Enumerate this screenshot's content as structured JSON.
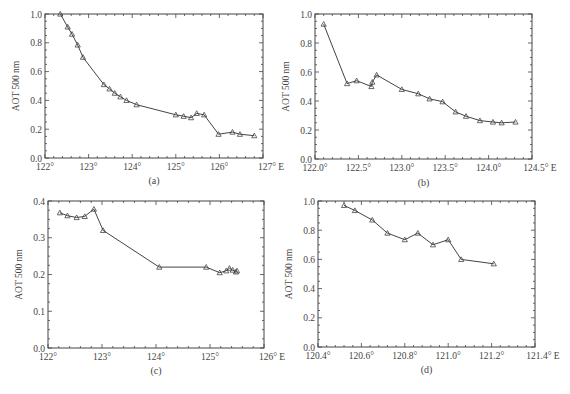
{
  "figure": {
    "ylabel": "AOT 500 nm",
    "marker": "triangle",
    "line_color": "#444444",
    "axis_color": "#444444",
    "background": "#ffffff"
  },
  "chart_data": [
    {
      "id": "a",
      "type": "line",
      "panel_label": "(a)",
      "title": "",
      "xlabel": "",
      "ylabel": "AOT 500 nm",
      "xlim": [
        122,
        127
      ],
      "ylim": [
        0.0,
        1.0
      ],
      "xticks": [
        122,
        123,
        124,
        125,
        126,
        127
      ],
      "xtick_labels": [
        "122°",
        "123°",
        "124°",
        "125°",
        "126°",
        "127° E"
      ],
      "yticks": [
        0.0,
        0.2,
        0.4,
        0.6,
        0.8,
        1.0
      ],
      "ytick_labels": [
        "0.0",
        "0.2",
        "0.4",
        "0.6",
        "0.8",
        "1.0"
      ],
      "grid": false,
      "legend": null,
      "series": [
        {
          "name": "AOT",
          "x": [
            122.35,
            122.52,
            122.62,
            122.75,
            122.87,
            123.35,
            123.48,
            123.6,
            123.73,
            123.87,
            124.1,
            125.0,
            125.18,
            125.35,
            125.48,
            125.65,
            125.98,
            126.3,
            126.47,
            126.8
          ],
          "y": [
            1.0,
            0.91,
            0.86,
            0.785,
            0.7,
            0.51,
            0.48,
            0.45,
            0.425,
            0.4,
            0.37,
            0.3,
            0.29,
            0.28,
            0.31,
            0.3,
            0.165,
            0.18,
            0.165,
            0.155
          ]
        }
      ]
    },
    {
      "id": "b",
      "type": "line",
      "panel_label": "(b)",
      "title": "",
      "xlabel": "",
      "ylabel": "AOT 500 nm",
      "xlim": [
        122.0,
        124.5
      ],
      "ylim": [
        0.0,
        1.0
      ],
      "xticks": [
        122.0,
        122.5,
        123.0,
        123.5,
        124.0,
        124.5
      ],
      "xtick_labels": [
        "122.0°",
        "122.5°",
        "123.0°",
        "123.5°",
        "124.0°",
        "124.5° E"
      ],
      "yticks": [
        0.0,
        0.2,
        0.4,
        0.6,
        0.8,
        1.0
      ],
      "ytick_labels": [
        "0.0",
        "0.2",
        "0.4",
        "0.6",
        "0.8",
        "1.0"
      ],
      "grid": false,
      "legend": null,
      "series": [
        {
          "name": "AOT",
          "x": [
            122.1,
            122.37,
            122.48,
            122.65,
            122.66,
            122.71,
            123.0,
            123.19,
            123.32,
            123.47,
            123.62,
            123.74,
            123.9,
            124.05,
            124.15,
            124.31
          ],
          "y": [
            0.93,
            0.52,
            0.54,
            0.5,
            0.53,
            0.58,
            0.48,
            0.45,
            0.415,
            0.395,
            0.325,
            0.295,
            0.265,
            0.255,
            0.25,
            0.255
          ]
        }
      ]
    },
    {
      "id": "c",
      "type": "line",
      "panel_label": "(c)",
      "title": "",
      "xlabel": "",
      "ylabel": "AOT 500 nm",
      "xlim": [
        122,
        126
      ],
      "ylim": [
        0.0,
        0.4
      ],
      "xticks": [
        122,
        123,
        124,
        125,
        126
      ],
      "xtick_labels": [
        "122°",
        "123°",
        "124°",
        "125°",
        "126° E"
      ],
      "yticks": [
        0.0,
        0.1,
        0.2,
        0.3,
        0.4
      ],
      "ytick_labels": [
        "0.0",
        "0.1",
        "0.2",
        "0.3",
        "0.4"
      ],
      "grid": false,
      "legend": null,
      "series": [
        {
          "name": "AOT",
          "x": [
            122.22,
            122.36,
            122.53,
            122.68,
            122.85,
            123.02,
            124.06,
            124.93,
            125.18,
            125.3,
            125.36,
            125.42,
            125.48,
            125.5
          ],
          "y": [
            0.368,
            0.36,
            0.355,
            0.358,
            0.378,
            0.32,
            0.22,
            0.22,
            0.205,
            0.21,
            0.217,
            0.212,
            0.207,
            0.21
          ]
        }
      ]
    },
    {
      "id": "d",
      "type": "line",
      "panel_label": "(d)",
      "title": "",
      "xlabel": "",
      "ylabel": "AOT 500 nm",
      "xlim": [
        120.4,
        121.4
      ],
      "ylim": [
        0.0,
        1.0
      ],
      "xticks": [
        120.4,
        120.6,
        120.8,
        121.0,
        121.2,
        121.4
      ],
      "xtick_labels": [
        "120.4°",
        "120.6°",
        "120.8°",
        "121.0°",
        "121.2°",
        "121.4° E"
      ],
      "yticks": [
        0.0,
        0.2,
        0.4,
        0.6,
        0.8,
        1.0
      ],
      "ytick_labels": [
        "0.0",
        "0.2",
        "0.4",
        "0.6",
        "0.8",
        "1.0"
      ],
      "grid": false,
      "legend": null,
      "series": [
        {
          "name": "AOT",
          "x": [
            120.52,
            120.57,
            120.65,
            120.72,
            120.8,
            120.86,
            120.93,
            121.0,
            121.06,
            121.21
          ],
          "y": [
            0.97,
            0.935,
            0.87,
            0.78,
            0.735,
            0.78,
            0.7,
            0.735,
            0.6,
            0.57
          ]
        }
      ]
    }
  ],
  "layout": {
    "panels": [
      {
        "id": "a",
        "left": 45,
        "top": 14,
        "right": 263,
        "bottom": 158,
        "label_y": 184
      },
      {
        "id": "b",
        "left": 315,
        "top": 14,
        "right": 532,
        "bottom": 159,
        "label_y": 186
      },
      {
        "id": "c",
        "left": 48,
        "top": 201,
        "right": 264,
        "bottom": 348,
        "label_y": 374
      },
      {
        "id": "d",
        "left": 318,
        "top": 201,
        "right": 535,
        "bottom": 347,
        "label_y": 373
      }
    ]
  }
}
